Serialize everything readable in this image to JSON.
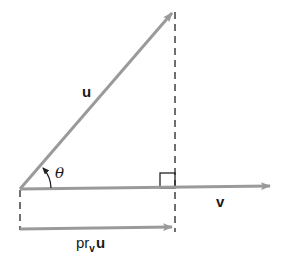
{
  "diagram": {
    "colors": {
      "vector": "#9a9a9a",
      "dashed": "#222222",
      "text": "#1a1a1a",
      "background": "#ffffff"
    },
    "labels": {
      "u": "u",
      "v": "v",
      "theta": "θ",
      "proj_prefix": "pr",
      "proj_sub": "v",
      "proj_vec": "u"
    },
    "elements": [
      {
        "id": "vector-u",
        "type": "arrow",
        "label": "u",
        "from": [
          20,
          189
        ],
        "to": [
          172,
          13
        ]
      },
      {
        "id": "vector-v",
        "type": "arrow",
        "label": "v",
        "from": [
          20,
          189
        ],
        "to": [
          270,
          186
        ]
      },
      {
        "id": "projection",
        "type": "arrow",
        "label": "pr_v u",
        "from": [
          20,
          229
        ],
        "to": [
          172,
          227
        ]
      },
      {
        "id": "perpendicular-dashed",
        "type": "dashed-line",
        "from": [
          175,
          12
        ],
        "to": [
          175,
          232
        ]
      },
      {
        "id": "left-dashed",
        "type": "dashed-line",
        "from": [
          20,
          189
        ],
        "to": [
          20,
          230
        ]
      },
      {
        "id": "right-angle-marker",
        "type": "square",
        "corner": [
          175,
          188
        ],
        "size": 15
      },
      {
        "id": "angle-theta",
        "type": "arc-arrow",
        "label": "θ",
        "center": [
          20,
          189
        ],
        "radius": 30
      }
    ]
  }
}
